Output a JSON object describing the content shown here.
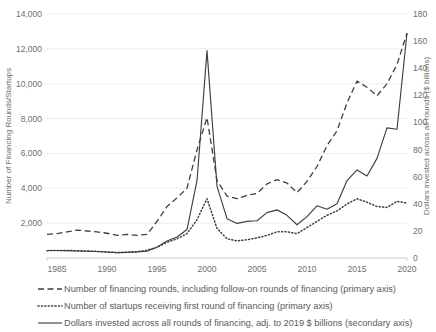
{
  "chart_data": {
    "type": "line",
    "title": "",
    "xlabel": "",
    "ylabel": "Number of Financing Rounds/Startups",
    "y2label": "Dollars invested across all rounds ($ billions)",
    "grid": true,
    "legend_position": "bottom",
    "xlim": [
      1984,
      2020
    ],
    "ylim": [
      0,
      14000
    ],
    "y2lim": [
      0,
      180
    ],
    "x_tick_labels": [
      "1985",
      "1990",
      "1995",
      "2000",
      "2005",
      "2010",
      "2015",
      "2020"
    ],
    "x_ticks": [
      1985,
      1990,
      1995,
      2000,
      2005,
      2010,
      2015,
      2020
    ],
    "y_tick_labels": [
      "0",
      "2,000",
      "4,000",
      "6,000",
      "8,000",
      "10,000",
      "12,000",
      "14,000"
    ],
    "y_ticks": [
      0,
      2000,
      4000,
      6000,
      8000,
      10000,
      12000,
      14000
    ],
    "y2_tick_labels": [
      "0",
      "20",
      "40",
      "60",
      "80",
      "100",
      "120",
      "140",
      "160",
      "180"
    ],
    "y2_ticks": [
      0,
      20,
      40,
      60,
      80,
      100,
      120,
      140,
      160,
      180
    ],
    "x": [
      1984,
      1985,
      1986,
      1987,
      1988,
      1989,
      1990,
      1991,
      1992,
      1993,
      1994,
      1995,
      1996,
      1997,
      1998,
      1999,
      2000,
      2001,
      2002,
      2003,
      2004,
      2005,
      2006,
      2007,
      2008,
      2009,
      2010,
      2011,
      2012,
      2013,
      2014,
      2015,
      2016,
      2017,
      2018,
      2019,
      2020
    ],
    "series": [
      {
        "name": "Number of financing rounds, including follow-on rounds of financing (primary axis)",
        "axis": "primary",
        "style": "dashed",
        "values": [
          1350,
          1400,
          1500,
          1600,
          1550,
          1500,
          1420,
          1300,
          1350,
          1300,
          1350,
          2100,
          2950,
          3450,
          4000,
          6200,
          8050,
          4450,
          3550,
          3400,
          3600,
          3700,
          4250,
          4500,
          4300,
          3750,
          4400,
          5250,
          6450,
          7300,
          8900,
          10150,
          9800,
          9300,
          10000,
          11100,
          12900
        ]
      },
      {
        "name": "Number of startups receiving first round of financing (primary axis)",
        "axis": "primary",
        "style": "dotted",
        "values": [
          420,
          430,
          430,
          420,
          400,
          380,
          340,
          310,
          330,
          360,
          450,
          620,
          900,
          1100,
          1400,
          2200,
          3400,
          1700,
          1100,
          980,
          1050,
          1150,
          1300,
          1500,
          1500,
          1400,
          1750,
          2100,
          2450,
          2700,
          3100,
          3400,
          3200,
          2950,
          2900,
          3250,
          3150
        ]
      },
      {
        "name": "Dollars invested across all rounds of financing, adj. to 2019 $ billions (secondary axis)",
        "axis": "secondary",
        "style": "solid",
        "values": [
          5.5,
          5.5,
          5.4,
          5.2,
          5.0,
          4.8,
          4.4,
          4.0,
          4.2,
          4.5,
          5.0,
          8.0,
          12.5,
          15.5,
          21.0,
          57.0,
          153.0,
          53.0,
          29.0,
          25.5,
          27.0,
          27.5,
          33.5,
          35.5,
          31.5,
          24.5,
          30.5,
          38.5,
          36.0,
          40.0,
          57.0,
          65.0,
          60.5,
          73.5,
          96.0,
          95.0,
          166.0
        ]
      }
    ]
  },
  "axes": {
    "left_title": "Number of Financing Rounds/Startups",
    "right_title": "Dollars invested across all rounds ($ billions)"
  },
  "legend": {
    "items": [
      {
        "style": "dashed",
        "label": "Number of financing rounds, including follow-on rounds of financing (primary axis)"
      },
      {
        "style": "dotted",
        "label": "Number of startups receiving first round of financing (primary axis)"
      },
      {
        "style": "solid",
        "label": "Dollars invested across all rounds of financing, adj. to 2019 $ billions (secondary axis)"
      }
    ]
  },
  "colors": {
    "line": "#3f3f3f",
    "grid": "#e8e8e8",
    "text": "#6e6e6e",
    "background": "#ffffff"
  }
}
